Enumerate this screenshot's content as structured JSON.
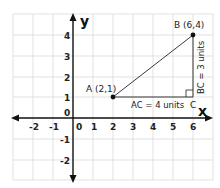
{
  "diagram": {
    "axes": {
      "x_label": "x",
      "y_label": "y",
      "x_ticks": [
        "-2",
        "-1",
        "0",
        "1",
        "2",
        "3",
        "4",
        "5",
        "6"
      ],
      "y_ticks": [
        "-2",
        "-1",
        "0",
        "1",
        "2",
        "3",
        "4"
      ],
      "origin_label": "0"
    },
    "points": [
      {
        "name": "A",
        "label": "A (2,1)",
        "x": 2,
        "y": 1
      },
      {
        "name": "B",
        "label": "B (6,4)",
        "x": 6,
        "y": 4
      },
      {
        "name": "C",
        "label": "C",
        "x": 6,
        "y": 1
      }
    ],
    "annotations": {
      "ac": "AC = 4 units",
      "bc": "BC = 3 units"
    },
    "colors": {
      "grid": "#d9d9d9",
      "axis": "#111111",
      "segment": "#222222"
    }
  }
}
